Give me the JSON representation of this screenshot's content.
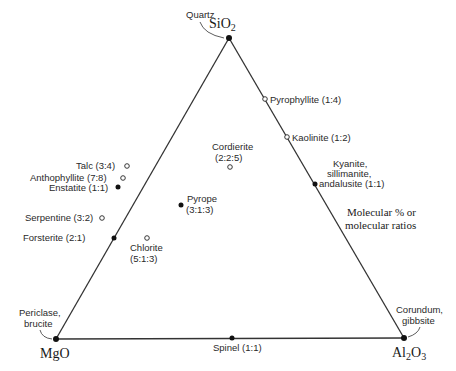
{
  "diagram": {
    "note": [
      "Molecular % or",
      "molecular ratios"
    ],
    "vertices": {
      "top": {
        "formula": "SiO",
        "sub": "2",
        "mineral": "Quartz"
      },
      "left": {
        "formula": "MgO",
        "mineral": [
          "Periclase,",
          "brucite"
        ]
      },
      "right": {
        "formula_a": "Al",
        "sub_a": "2",
        "formula_b": "O",
        "sub_b": "3",
        "mineral": [
          "Corundum,",
          "gibbsite"
        ]
      }
    },
    "minerals": [
      {
        "name": "Pyrophyllite",
        "ratio": "(1:4)",
        "marker": "hollow",
        "edge": "Al2O3-SiO2"
      },
      {
        "name": "Kaolinite",
        "ratio": "(1:2)",
        "marker": "hollow",
        "edge": "Al2O3-SiO2"
      },
      {
        "name": "Kyanite, sillimanite, andalusite",
        "lines": [
          "Kyanite,",
          "sillimanite,",
          "andalusite (1:1)"
        ],
        "ratio": "(1:1)",
        "marker": "filled",
        "edge": "Al2O3-SiO2"
      },
      {
        "name": "Cordierite",
        "ratio": "(2:2:5)",
        "marker": "hollow",
        "edge": "interior"
      },
      {
        "name": "Talc",
        "ratio": "(3:4)",
        "marker": "hollow",
        "edge": "MgO-SiO2"
      },
      {
        "name": "Anthophyllite",
        "ratio": "(7:8)",
        "marker": "hollow",
        "edge": "MgO-SiO2"
      },
      {
        "name": "Enstatite",
        "ratio": "(1:1)",
        "marker": "filled",
        "edge": "MgO-SiO2"
      },
      {
        "name": "Pyrope",
        "ratio": "(3:1:3)",
        "marker": "filled",
        "edge": "interior"
      },
      {
        "name": "Serpentine",
        "ratio": "(3:2)",
        "marker": "hollow",
        "edge": "MgO-SiO2"
      },
      {
        "name": "Forsterite",
        "ratio": "(2:1)",
        "marker": "filled",
        "edge": "MgO-SiO2"
      },
      {
        "name": "Chlorite",
        "ratio": "(5:1:3)",
        "marker": "hollow",
        "edge": "interior"
      },
      {
        "name": "Spinel",
        "ratio": "(1:1)",
        "marker": "filled",
        "edge": "MgO-Al2O3"
      }
    ],
    "labels": {
      "pyrophyllite": "Pyrophyllite (1:4)",
      "kaolinite": "Kaolinite (1:2)",
      "kyanite_1": "Kyanite,",
      "kyanite_2": "sillimanite,",
      "kyanite_3": "andalusite (1:1)",
      "cordierite_1": "Cordierite",
      "cordierite_2": "(2:2:5)",
      "talc": "Talc (3:4)",
      "anthophyllite": "Anthophyllite (7:8)",
      "enstatite": "Enstatite (1:1)",
      "pyrope_1": "Pyrope",
      "pyrope_2": "(3:1:3)",
      "serpentine": "Serpentine (3:2)",
      "forsterite": "Forsterite (2:1)",
      "chlorite_1": "Chlorite",
      "chlorite_2": "(5:1:3)",
      "spinel": "Spinel (1:1)"
    }
  }
}
